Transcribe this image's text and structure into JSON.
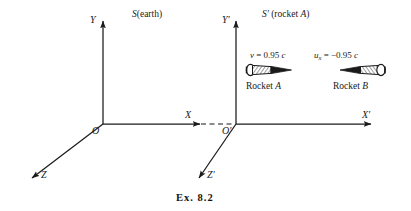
{
  "figure": {
    "caption": "Ex. 8.2",
    "background_color": "#ffffff",
    "ink_color": "#1a1a1a"
  },
  "frames": [
    {
      "id": "S",
      "label_symbol": "S",
      "label_paren": "(earth)",
      "origin_label": "O",
      "axes": [
        {
          "name": "Y",
          "label": "Y"
        },
        {
          "name": "X",
          "label": "X"
        },
        {
          "name": "Z",
          "label": "Z"
        }
      ]
    },
    {
      "id": "S-prime",
      "label_symbol": "S′",
      "label_paren": "(rocket A)",
      "origin_label": "O′",
      "axes": [
        {
          "name": "Y-prime",
          "label": "Y′"
        },
        {
          "name": "X-prime",
          "label": "X′"
        },
        {
          "name": "Z-prime",
          "label": "Z′"
        }
      ]
    }
  ],
  "rockets": [
    {
      "name": "Rocket A",
      "name_prefix": "Rocket ",
      "name_symbol": "A",
      "direction": "right",
      "velocity": {
        "symbol": "v",
        "subscript": "",
        "equals": " = ",
        "value": "0.95",
        "unit": "c",
        "full": "v = 0.95 c"
      }
    },
    {
      "name": "Rocket B",
      "name_prefix": "Rocket ",
      "name_symbol": "B",
      "direction": "left",
      "velocity": {
        "symbol": "u",
        "subscript": "x",
        "equals": " = ",
        "value": "−0.95",
        "unit": "c",
        "full": "u_x = −0.95 c"
      }
    }
  ]
}
